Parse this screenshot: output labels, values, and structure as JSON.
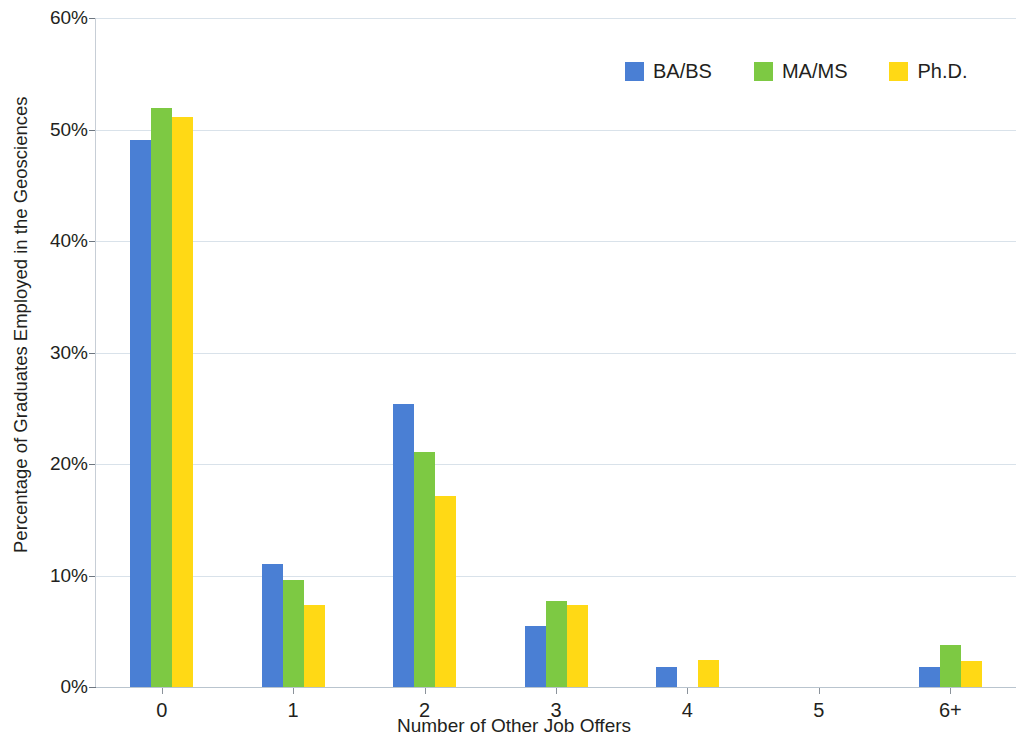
{
  "chart_data": {
    "type": "bar",
    "title": "",
    "xlabel": "Number of Other Job Offers",
    "ylabel": "Percentage of Graduates Employed in the Geosciences",
    "categories": [
      "0",
      "1",
      "2",
      "3",
      "4",
      "5",
      "6+"
    ],
    "ylim": [
      0,
      60
    ],
    "yticks": [
      0,
      10,
      20,
      30,
      40,
      50,
      60
    ],
    "ytick_labels": [
      "0%",
      "10%",
      "20%",
      "30%",
      "40%",
      "50%",
      "60%"
    ],
    "y_unit": "%",
    "grid": true,
    "legend_position": "top-right",
    "series": [
      {
        "name": "BA/BS",
        "color": "#4a7fd4",
        "values": [
          49.1,
          11.0,
          25.4,
          5.5,
          1.8,
          0,
          1.8
        ]
      },
      {
        "name": "MA/MS",
        "color": "#7dc943",
        "values": [
          51.9,
          9.6,
          21.1,
          7.7,
          0,
          0,
          3.8
        ]
      },
      {
        "name": "Ph.D.",
        "color": "#ffd915",
        "values": [
          51.1,
          7.4,
          17.1,
          7.4,
          2.4,
          0,
          2.3
        ]
      }
    ]
  },
  "legend": {
    "items": [
      {
        "label": "BA/BS",
        "color": "#4a7fd4",
        "swatch_name": "legend-swatch-babs"
      },
      {
        "label": "MA/MS",
        "color": "#7dc943",
        "swatch_name": "legend-swatch-mams"
      },
      {
        "label": "Ph.D.",
        "color": "#ffd915",
        "swatch_name": "legend-swatch-phd"
      }
    ]
  },
  "axes": {
    "y_title": "Percentage of Graduates Employed in the Geosciences",
    "x_title": "Number of Other Job Offers"
  }
}
